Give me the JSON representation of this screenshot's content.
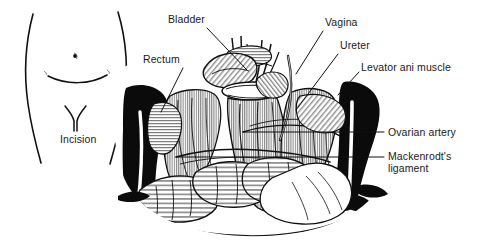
{
  "figure": {
    "type": "anatomical-line-drawing",
    "background_color": "#ffffff",
    "ink_color": "#111111"
  },
  "panels": {
    "left": {
      "name": "abdomen-outline-panel",
      "caption": "Incision",
      "features": [
        "abdomen-outline",
        "navel",
        "pubic-crease",
        "incision-mark"
      ]
    },
    "right": {
      "name": "pelvic-dissection-panel",
      "features": [
        "retractor-blades",
        "bladder",
        "uterus",
        "vagina",
        "ureter",
        "rectum",
        "levator-ani-muscle",
        "ovarian-artery",
        "mackenrodt-ligament",
        "pelvic-bone-left",
        "pelvic-bone-right",
        "bowel-loops"
      ]
    }
  },
  "labels": [
    {
      "id": "bladder",
      "text": "Bladder",
      "x": 168,
      "y": 13,
      "anchor": "left",
      "leader": {
        "x1": 207,
        "y1": 28,
        "x2": 247,
        "y2": 70
      }
    },
    {
      "id": "rectum",
      "text": "Rectum",
      "x": 143,
      "y": 53,
      "anchor": "left",
      "leader": {
        "x1": 183,
        "y1": 68,
        "x2": 161,
        "y2": 112
      }
    },
    {
      "id": "vagina",
      "text": "Vagina",
      "x": 325,
      "y": 16,
      "anchor": "left",
      "leader": {
        "x1": 323,
        "y1": 31,
        "x2": 296,
        "y2": 74
      }
    },
    {
      "id": "ureter",
      "text": "Ureter",
      "x": 340,
      "y": 39,
      "anchor": "left",
      "leader": {
        "x1": 338,
        "y1": 54,
        "x2": 296,
        "y2": 110
      }
    },
    {
      "id": "levator-ani-muscle",
      "text": "Levator ani muscle",
      "x": 361,
      "y": 61,
      "anchor": "left",
      "leader": {
        "x1": 359,
        "y1": 72,
        "x2": 338,
        "y2": 95
      }
    },
    {
      "id": "ovarian-artery",
      "text": "Ovarian artery",
      "x": 386,
      "y": 126,
      "anchor": "left",
      "leader": {
        "x1": 384,
        "y1": 132,
        "x2": 243,
        "y2": 132
      }
    },
    {
      "id": "mackenrodt-ligament",
      "text": "Mackenrodt's\nligament",
      "x": 386,
      "y": 151,
      "anchor": "left",
      "leader": {
        "x1": 384,
        "y1": 157,
        "x2": 176,
        "y2": 157
      }
    },
    {
      "id": "incision",
      "text": "Incision",
      "x": 62,
      "y": 130,
      "anchor": "left",
      "leader": null
    }
  ],
  "label_texts": {
    "bladder": "Bladder",
    "rectum": "Rectum",
    "vagina": "Vagina",
    "ureter": "Ureter",
    "levator_ani_muscle": "Levator ani muscle",
    "ovarian_artery": "Ovarian artery",
    "mackenrodt_ligament": "Mackenrodt's\nligament",
    "incision": "Incision"
  }
}
